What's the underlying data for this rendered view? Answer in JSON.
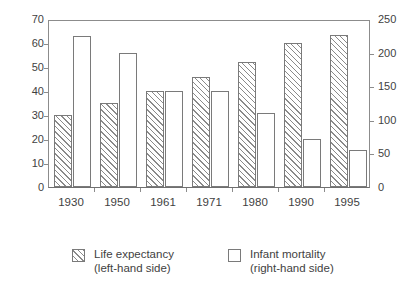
{
  "chart_data": {
    "type": "bar",
    "title": "",
    "subtitle": "",
    "xlabel": "",
    "categories": [
      "1930",
      "1950",
      "1961",
      "1971",
      "1980",
      "1990",
      "1995"
    ],
    "series": [
      {
        "name": "Life expectancy",
        "axis": "left",
        "legend_label": "Life expectancy",
        "legend_sublabel": "(left-hand side)",
        "style": "hatched",
        "values": [
          30,
          35,
          40,
          46,
          52,
          60,
          63.5
        ]
      },
      {
        "name": "Infant mortality",
        "axis": "right",
        "legend_label": "Infant mortality",
        "legend_sublabel": "(right-hand side)",
        "style": "open",
        "values": [
          225,
          200,
          143,
          143,
          110,
          72,
          55
        ]
      }
    ],
    "left_axis": {
      "label": "",
      "ylim": [
        0,
        70
      ],
      "ticks": [
        0,
        10,
        20,
        30,
        40,
        50,
        60,
        70
      ]
    },
    "right_axis": {
      "label": "",
      "ylim": [
        0,
        250
      ],
      "ticks": [
        0,
        50,
        100,
        150,
        200,
        250
      ]
    },
    "grid": false,
    "legend_position": "bottom"
  },
  "legend": {
    "entries": [
      {
        "label": "Life expectancy",
        "sublabel": "(left-hand side)"
      },
      {
        "label": "Infant mortality",
        "sublabel": "(right-hand side)"
      }
    ]
  },
  "colors": {
    "axis": "#8c8c8c",
    "bar_outline": "#7a7a7a",
    "hatch": "#8a8a8a",
    "text": "#3f3f3f",
    "background": "#ffffff"
  }
}
